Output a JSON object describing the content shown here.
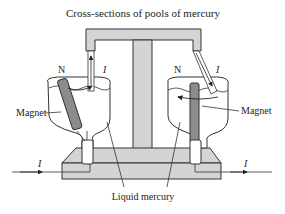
{
  "diagram": {
    "title": "Cross-sections of pools of mercury",
    "labels": {
      "left_magnet": "Magnet",
      "right_magnet": "Magnet",
      "liquid_mercury": "Liquid mercury",
      "left_north": "N",
      "right_north": "N",
      "left_current_top": "I",
      "right_current_top": "I",
      "current_in": "I",
      "current_out": "I"
    },
    "colors": {
      "fill_gray": "#d4d4d4",
      "magnet_gray": "#8c8c8c",
      "stroke": "#333333",
      "background": "#ffffff"
    }
  }
}
